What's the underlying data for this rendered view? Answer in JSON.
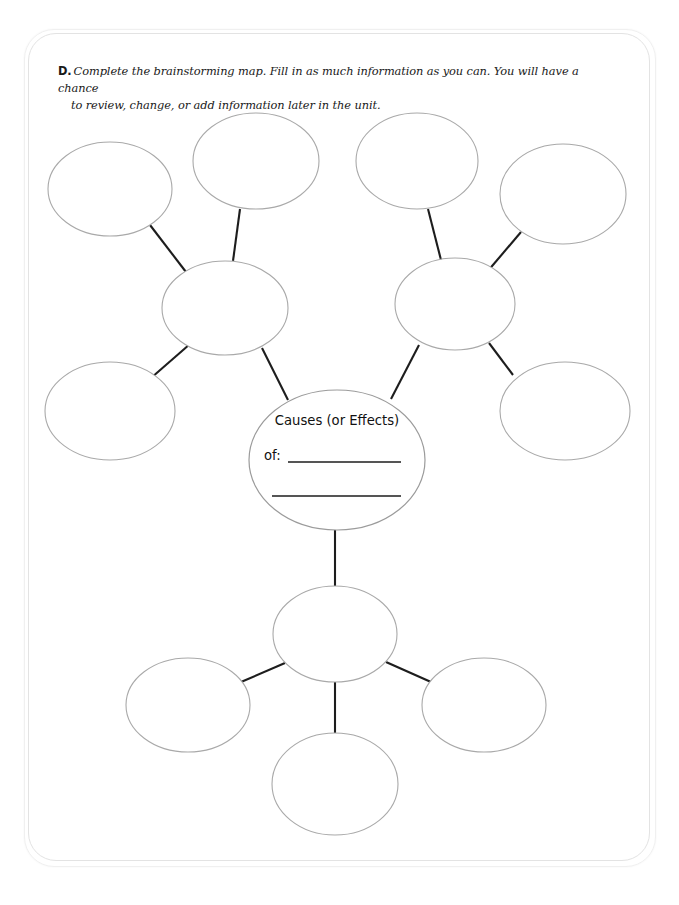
{
  "worksheet": {
    "item_label": "D.",
    "instruction_line1": "Complete the brainstorming map. Fill in as much information as you can. You will have a chance",
    "instruction_line2": "to review, change, or add information later in the unit."
  },
  "center_node": {
    "title": "Causes (or Effects)",
    "prefix": "of:",
    "blank_line_1": "",
    "blank_line_2": ""
  },
  "colors": {
    "page_background": "#ffffff",
    "card_border": "#e3e3e3",
    "oval_stroke": "#a9a9a9",
    "connector_stroke": "#1d1d1d",
    "text": "#191919"
  },
  "diagram": {
    "type": "brainstorming-bubble-map",
    "total_blank_ovals": 13,
    "clusters": [
      {
        "name": "upper-left-cluster",
        "hub": "left-hub-oval",
        "leaves": [
          "top-left-oval",
          "top-mid-left-oval",
          "left-side-oval"
        ]
      },
      {
        "name": "upper-right-cluster",
        "hub": "right-hub-oval",
        "leaves": [
          "top-mid-right-oval",
          "top-right-oval",
          "right-side-oval"
        ]
      },
      {
        "name": "lower-cluster",
        "hub": "bottom-hub-oval",
        "leaves": [
          "bottom-left-oval",
          "bottom-center-oval",
          "bottom-right-oval"
        ]
      }
    ],
    "ovals": [
      {
        "id": "top-left-oval",
        "cx": 110,
        "cy": 189,
        "rx": 62,
        "ry": 47,
        "text": ""
      },
      {
        "id": "top-mid-left-oval",
        "cx": 256,
        "cy": 161,
        "rx": 63,
        "ry": 48,
        "text": ""
      },
      {
        "id": "top-mid-right-oval",
        "cx": 417,
        "cy": 161,
        "rx": 61,
        "ry": 48,
        "text": ""
      },
      {
        "id": "top-right-oval",
        "cx": 563,
        "cy": 194,
        "rx": 63,
        "ry": 50,
        "text": ""
      },
      {
        "id": "left-hub-oval",
        "cx": 225,
        "cy": 308,
        "rx": 63,
        "ry": 47,
        "text": ""
      },
      {
        "id": "right-hub-oval",
        "cx": 455,
        "cy": 304,
        "rx": 60,
        "ry": 46,
        "text": ""
      },
      {
        "id": "left-side-oval",
        "cx": 110,
        "cy": 411,
        "rx": 65,
        "ry": 49,
        "text": ""
      },
      {
        "id": "right-side-oval",
        "cx": 565,
        "cy": 411,
        "rx": 65,
        "ry": 49,
        "text": ""
      },
      {
        "id": "center-oval",
        "cx": 337,
        "cy": 460,
        "rx": 88,
        "ry": 70,
        "text": "Causes (or Effects) of:"
      },
      {
        "id": "bottom-hub-oval",
        "cx": 335,
        "cy": 634,
        "rx": 62,
        "ry": 48,
        "text": ""
      },
      {
        "id": "bottom-left-oval",
        "cx": 188,
        "cy": 705,
        "rx": 62,
        "ry": 47,
        "text": ""
      },
      {
        "id": "bottom-center-oval",
        "cx": 335,
        "cy": 784,
        "rx": 63,
        "ry": 51,
        "text": ""
      },
      {
        "id": "bottom-right-oval",
        "cx": 484,
        "cy": 705,
        "rx": 62,
        "ry": 47,
        "text": ""
      }
    ],
    "connectors": [
      {
        "id": "connector-top-left-to-left-hub",
        "x1": 150,
        "y1": 225,
        "x2": 186,
        "y2": 272
      },
      {
        "id": "connector-top-mid-left-to-left-hub",
        "x1": 240,
        "y1": 209,
        "x2": 233,
        "y2": 261
      },
      {
        "id": "connector-left-side-to-left-hub",
        "x1": 151,
        "y1": 378,
        "x2": 190,
        "y2": 344
      },
      {
        "id": "connector-left-hub-to-center",
        "x1": 262,
        "y1": 348,
        "x2": 288,
        "y2": 400
      },
      {
        "id": "connector-top-mid-right-to-right-hub",
        "x1": 428,
        "y1": 209,
        "x2": 441,
        "y2": 260
      },
      {
        "id": "connector-top-right-to-right-hub",
        "x1": 521,
        "y1": 232,
        "x2": 487,
        "y2": 272
      },
      {
        "id": "connector-right-side-to-right-hub",
        "x1": 513,
        "y1": 375,
        "x2": 489,
        "y2": 343
      },
      {
        "id": "connector-right-hub-to-center",
        "x1": 419,
        "y1": 345,
        "x2": 391,
        "y2": 399
      },
      {
        "id": "connector-center-to-bottom-hub",
        "x1": 335,
        "y1": 530,
        "x2": 335,
        "y2": 587
      },
      {
        "id": "connector-bottom-hub-to-bottom-left",
        "x1": 285,
        "y1": 663,
        "x2": 241,
        "y2": 682
      },
      {
        "id": "connector-bottom-hub-to-bottom-right",
        "x1": 386,
        "y1": 662,
        "x2": 431,
        "y2": 682
      },
      {
        "id": "connector-bottom-hub-to-bottom-center",
        "x1": 335,
        "y1": 681,
        "x2": 335,
        "y2": 734
      }
    ],
    "blank_rules": [
      {
        "id": "center-blank-rule-1",
        "x1": 288,
        "y1": 462,
        "x2": 401,
        "y2": 462
      },
      {
        "id": "center-blank-rule-2",
        "x1": 272,
        "y1": 496,
        "x2": 401,
        "y2": 496
      }
    ]
  }
}
